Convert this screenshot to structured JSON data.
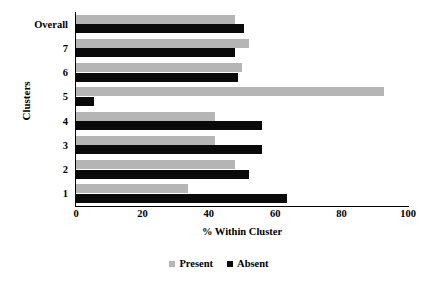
{
  "chart_data": {
    "type": "bar",
    "orientation": "horizontal",
    "title": "",
    "xlabel": "% Within Cluster",
    "ylabel": "Clusters",
    "xlim": [
      0,
      100
    ],
    "xticks": [
      0,
      20,
      40,
      60,
      80,
      100
    ],
    "grid": false,
    "legend_position": "bottom",
    "categories": [
      "Overall",
      "7",
      "6",
      "5",
      "4",
      "3",
      "2",
      "1"
    ],
    "series": [
      {
        "name": "Present",
        "color": "#b5b5b5",
        "values": [
          48,
          52,
          50,
          92.8,
          42,
          42,
          48,
          33.7
        ]
      },
      {
        "name": "Absent",
        "color": "#0a0a0a",
        "values": [
          50.5,
          48,
          48.7,
          5.4,
          56,
          56,
          52,
          63.6
        ]
      }
    ]
  },
  "axes": {
    "x_title": "% Within Cluster",
    "y_title": "Clusters"
  },
  "legend": {
    "items": [
      {
        "label": "Present",
        "color": "#b5b5b5",
        "swatch_name": "legend-swatch-present"
      },
      {
        "label": "Absent",
        "color": "#0a0a0a",
        "swatch_name": "legend-swatch-absent"
      }
    ]
  }
}
